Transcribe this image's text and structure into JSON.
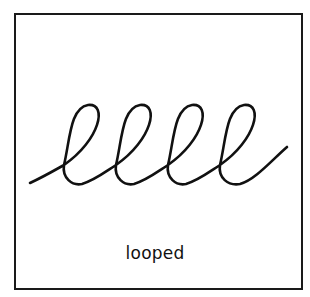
{
  "diagram": {
    "caption": "looped",
    "shape": "looped-line",
    "loop_count": 4,
    "stroke_color": "#111111",
    "border_color": "#1a1a1a",
    "background": "#ffffff"
  }
}
